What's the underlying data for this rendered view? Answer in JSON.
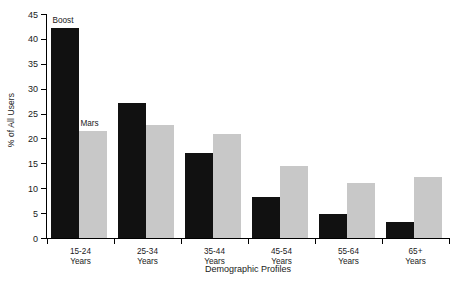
{
  "chart_data": {
    "type": "bar",
    "title": "",
    "xlabel": "Demographic Profiles",
    "ylabel": "% of All Users",
    "categories": [
      "15-24\nYears",
      "25-34\nYears",
      "35-44\nYears",
      "45-54\nYears",
      "55-64\nYears",
      "65+\nYears"
    ],
    "category_lines": [
      [
        "15-24",
        "Years"
      ],
      [
        "25-34",
        "Years"
      ],
      [
        "35-44",
        "Years"
      ],
      [
        "45-54",
        "Years"
      ],
      [
        "55-64",
        "Years"
      ],
      [
        "65+",
        "Years"
      ]
    ],
    "series": [
      {
        "name": "Boost",
        "color": "#111111",
        "values": [
          42.2,
          27.1,
          17.1,
          8.2,
          4.8,
          3.2
        ]
      },
      {
        "name": "Mars",
        "color": "#c8c8c8",
        "values": [
          21.4,
          22.7,
          20.9,
          14.5,
          11.0,
          12.2
        ]
      }
    ],
    "ylim": [
      0,
      45
    ],
    "yticks": [
      0,
      5,
      10,
      15,
      20,
      25,
      30,
      35,
      40,
      45
    ],
    "ytick_labels": [
      "0",
      "5",
      "10",
      "15",
      "20",
      "25",
      "30",
      "35",
      "40",
      "45"
    ],
    "grid": false,
    "legend": "inline-annotations",
    "annotations": [
      {
        "text": "Boost",
        "series": 0,
        "group": 0
      },
      {
        "text": "Mars",
        "series": 1,
        "group": 0
      }
    ]
  }
}
